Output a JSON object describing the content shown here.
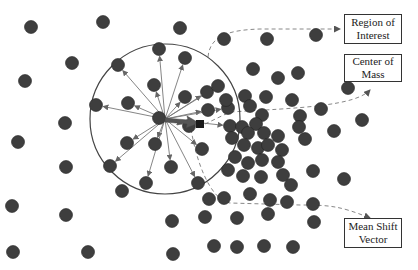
{
  "diagram": {
    "title": "Mean Shift",
    "colors": {
      "point_fill": "#3e3e3e",
      "point_stroke": "#222222",
      "circle_stroke": "#444444",
      "arrow_stroke": "#777777",
      "dashed": "#888888",
      "mean_shift_arrow": "#555555",
      "center_of_mass": "#1a1a1a"
    },
    "labels": {
      "region_of_interest": [
        "Region of",
        "Interest"
      ],
      "center_of_mass": [
        "Center of",
        "Mass"
      ],
      "mean_shift_vector": [
        "Mean Shift",
        "Vector"
      ]
    },
    "window": {
      "cx": 165,
      "cy": 119,
      "r": 75
    },
    "center_of_mass_pt": {
      "x": 200,
      "y": 124
    },
    "point_radius": 6.5,
    "points_inside": [
      [
        159,
        49
      ],
      [
        118,
        65
      ],
      [
        185,
        58
      ],
      [
        96,
        105
      ],
      [
        154,
        85
      ],
      [
        128,
        103
      ],
      [
        185,
        97
      ],
      [
        159,
        118
      ],
      [
        207,
        92
      ],
      [
        218,
        86
      ],
      [
        208,
        110
      ],
      [
        127,
        143
      ],
      [
        155,
        144
      ],
      [
        202,
        149
      ],
      [
        146,
        183
      ],
      [
        171,
        167
      ],
      [
        198,
        183
      ],
      [
        110,
        166
      ],
      [
        189,
        126
      ],
      [
        228,
        108
      ],
      [
        230,
        126
      ]
    ],
    "points_outside": [
      [
        31,
        27
      ],
      [
        103,
        22
      ],
      [
        180,
        28
      ],
      [
        72,
        63
      ],
      [
        25,
        81
      ],
      [
        65,
        123
      ],
      [
        18,
        142
      ],
      [
        66,
        167
      ],
      [
        12,
        206
      ],
      [
        66,
        215
      ],
      [
        13,
        252
      ],
      [
        88,
        252
      ],
      [
        122,
        191
      ],
      [
        172,
        221
      ],
      [
        173,
        254
      ],
      [
        224,
        39
      ],
      [
        267,
        39
      ],
      [
        316,
        35
      ],
      [
        253,
        69
      ],
      [
        245,
        96
      ],
      [
        278,
        78
      ],
      [
        298,
        73
      ],
      [
        321,
        109
      ],
      [
        348,
        88
      ],
      [
        334,
        131
      ],
      [
        362,
        120
      ],
      [
        344,
        179
      ],
      [
        226,
        100
      ],
      [
        250,
        106
      ],
      [
        266,
        97
      ],
      [
        262,
        115
      ],
      [
        292,
        100
      ],
      [
        300,
        116
      ],
      [
        256,
        124
      ],
      [
        242,
        127
      ],
      [
        232,
        138
      ],
      [
        248,
        133
      ],
      [
        264,
        133
      ],
      [
        278,
        136
      ],
      [
        299,
        127
      ],
      [
        244,
        145
      ],
      [
        258,
        148
      ],
      [
        268,
        145
      ],
      [
        282,
        150
      ],
      [
        235,
        157
      ],
      [
        248,
        163
      ],
      [
        262,
        160
      ],
      [
        278,
        162
      ],
      [
        228,
        170
      ],
      [
        243,
        176
      ],
      [
        261,
        177
      ],
      [
        283,
        175
      ],
      [
        291,
        185
      ],
      [
        313,
        171
      ],
      [
        305,
        139
      ],
      [
        313,
        204
      ],
      [
        224,
        198
      ],
      [
        250,
        194
      ],
      [
        270,
        200
      ],
      [
        209,
        199
      ],
      [
        287,
        202
      ],
      [
        237,
        218
      ],
      [
        268,
        214
      ],
      [
        214,
        246
      ],
      [
        237,
        247
      ],
      [
        264,
        246
      ],
      [
        293,
        247
      ],
      [
        314,
        222
      ],
      [
        205,
        217
      ]
    ]
  }
}
